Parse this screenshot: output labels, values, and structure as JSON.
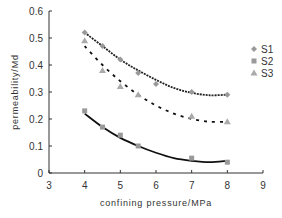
{
  "chart_data": {
    "type": "line",
    "title": "",
    "xlabel": "confining pressure/MPa",
    "ylabel": "permeability/Md",
    "xlim": [
      3,
      9
    ],
    "ylim": [
      0,
      0.6
    ],
    "xticks": [
      "3",
      "4",
      "5",
      "6",
      "7",
      "8",
      "9"
    ],
    "yticks": [
      "0",
      "0.1",
      "0.2",
      "0.3",
      "0.4",
      "0.5",
      "0.6"
    ],
    "grid": false,
    "legend_position": "right",
    "series": [
      {
        "name": "S1",
        "marker": "diamond",
        "line": "solid-dotted",
        "color": "#999999",
        "x": [
          4,
          4.5,
          5,
          5.5,
          6,
          7,
          8
        ],
        "y": [
          0.52,
          0.47,
          0.42,
          0.37,
          0.33,
          0.3,
          0.29
        ]
      },
      {
        "name": "S2",
        "marker": "square",
        "line": "solid",
        "color": "#999999",
        "x": [
          4,
          4.5,
          5,
          5.5,
          7,
          8
        ],
        "y": [
          0.23,
          0.17,
          0.14,
          0.1,
          0.055,
          0.04
        ]
      },
      {
        "name": "S3",
        "marker": "triangle",
        "line": "dashed",
        "color": "#aaaaaa",
        "x": [
          4,
          4.5,
          5,
          5.5,
          7,
          8
        ],
        "y": [
          0.49,
          0.38,
          0.32,
          0.29,
          0.21,
          0.19
        ]
      }
    ],
    "fit_curves": [
      {
        "series": "S1",
        "style": "solid-dotted",
        "x": [
          4,
          4.5,
          5,
          5.5,
          6,
          6.5,
          7,
          7.5,
          8
        ],
        "y": [
          0.52,
          0.47,
          0.42,
          0.38,
          0.345,
          0.315,
          0.297,
          0.288,
          0.29
        ]
      },
      {
        "series": "S3",
        "style": "dashed",
        "x": [
          4,
          4.5,
          5,
          5.5,
          6,
          6.5,
          7,
          7.5,
          8
        ],
        "y": [
          0.47,
          0.4,
          0.34,
          0.29,
          0.25,
          0.22,
          0.2,
          0.19,
          0.19
        ]
      },
      {
        "series": "S2",
        "style": "solid",
        "x": [
          4,
          4.5,
          5,
          5.5,
          6,
          6.5,
          7,
          7.5,
          8
        ],
        "y": [
          0.22,
          0.17,
          0.13,
          0.1,
          0.075,
          0.055,
          0.045,
          0.04,
          0.045
        ]
      }
    ]
  }
}
